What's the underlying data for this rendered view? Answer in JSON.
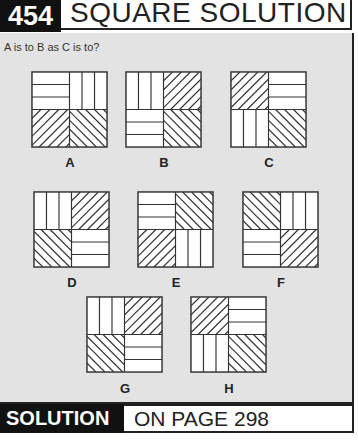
{
  "header": {
    "number": "454",
    "title": "SQUARE SOLUTION"
  },
  "question": "A is to B as C is to?",
  "colors": {
    "panel_bg": "#e3e3e3",
    "dark": "#111111",
    "line": "#333333"
  },
  "squares": [
    {
      "label": "A",
      "tl": "horizontal",
      "tr": "vertical",
      "bl": "diag-up",
      "br": "diag-down"
    },
    {
      "label": "B",
      "tl": "vertical",
      "tr": "diag-up",
      "bl": "horizontal",
      "br": "diag-down"
    },
    {
      "label": "C",
      "tl": "diag-up",
      "tr": "horizontal",
      "bl": "vertical",
      "br": "diag-down"
    },
    {
      "label": "D",
      "tl": "vertical",
      "tr": "diag-up",
      "bl": "diag-down",
      "br": "horizontal"
    },
    {
      "label": "E",
      "tl": "horizontal",
      "tr": "diag-down",
      "bl": "diag-up",
      "br": "vertical"
    },
    {
      "label": "F",
      "tl": "diag-down",
      "tr": "vertical",
      "bl": "horizontal",
      "br": "diag-up"
    },
    {
      "label": "G",
      "tl": "vertical",
      "tr": "diag-up",
      "bl": "diag-down",
      "br": "horizontal"
    },
    {
      "label": "H",
      "tl": "diag-up",
      "tr": "horizontal",
      "bl": "vertical",
      "br": "diag-down"
    }
  ],
  "footer": {
    "solution_label": "SOLUTION",
    "page_ref": "ON PAGE 298"
  }
}
